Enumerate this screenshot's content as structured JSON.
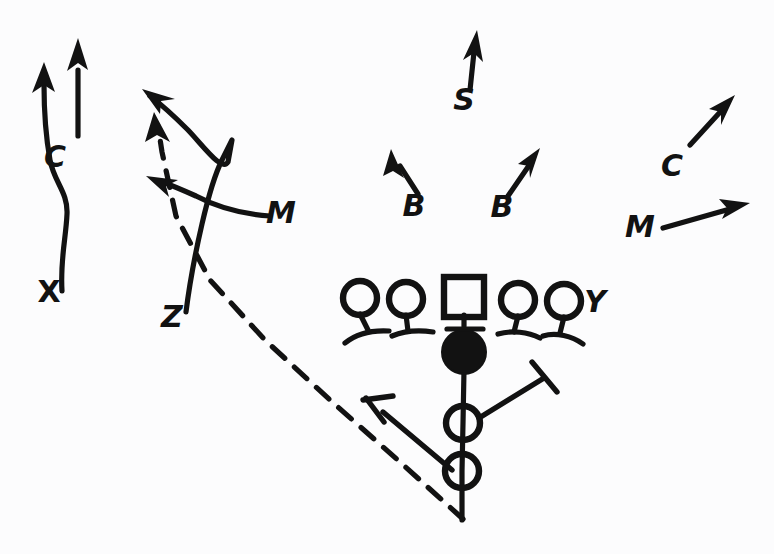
{
  "diagram": {
    "type": "hand-drawn-playbook",
    "background_color": "#fcfcfd",
    "ink_color": "#121212"
  },
  "offense": {
    "linemen": [
      {
        "id": "lt",
        "label": "",
        "shape": "circle",
        "x": 360,
        "y": 298
      },
      {
        "id": "lg",
        "label": "",
        "shape": "circle",
        "x": 406,
        "y": 299
      },
      {
        "id": "center",
        "label": "",
        "shape": "square",
        "x": 464,
        "y": 297
      },
      {
        "id": "rg",
        "label": "",
        "shape": "circle",
        "x": 518,
        "y": 300
      },
      {
        "id": "rt",
        "label": "",
        "shape": "circle",
        "x": 564,
        "y": 301
      }
    ],
    "quarterback": {
      "id": "qb",
      "label": "",
      "shape": "filled-circle",
      "x": 464,
      "y": 352
    },
    "backs": [
      {
        "id": "back-1",
        "label": "",
        "shape": "circle",
        "x": 462,
        "y": 423
      },
      {
        "id": "back-2",
        "label": "",
        "shape": "circle",
        "x": 462,
        "y": 471
      }
    ],
    "receivers": [
      {
        "id": "x-receiver",
        "label": "X",
        "label_x": 49,
        "label_y": 302
      },
      {
        "id": "y-receiver",
        "label": "Y",
        "label_x": 595,
        "label_y": 312
      },
      {
        "id": "z-receiver",
        "label": "Z",
        "label_x": 172,
        "label_y": 327
      }
    ]
  },
  "defense": {
    "players": [
      {
        "id": "corner-left",
        "label": "C",
        "label_x": 55,
        "label_y": 167
      },
      {
        "id": "mike-left",
        "label": "M",
        "label_x": 281,
        "label_y": 223
      },
      {
        "id": "safety",
        "label": "S",
        "label_x": 464,
        "label_y": 110
      },
      {
        "id": "backer-left",
        "label": "B",
        "label_x": 414,
        "label_y": 216
      },
      {
        "id": "backer-right",
        "label": "B",
        "label_x": 502,
        "label_y": 217
      },
      {
        "id": "corner-right",
        "label": "C",
        "label_x": 672,
        "label_y": 176
      },
      {
        "id": "mike-right",
        "label": "M",
        "label_x": 640,
        "label_y": 237
      }
    ]
  },
  "routes": [
    {
      "id": "x-route",
      "player": "X",
      "style": "solid",
      "terminator": "arrow"
    },
    {
      "id": "z-route",
      "player": "Z",
      "style": "solid",
      "terminator": "arrow"
    },
    {
      "id": "motion-route",
      "player": "back",
      "style": "dashed",
      "terminator": "arrow"
    },
    {
      "id": "corner-left-drop",
      "player": "C",
      "style": "solid",
      "terminator": "arrow"
    },
    {
      "id": "mike-left-blitz",
      "player": "M",
      "style": "solid",
      "terminator": "arrow"
    },
    {
      "id": "safety-drop",
      "player": "S",
      "style": "solid",
      "terminator": "arrow"
    },
    {
      "id": "backer-left-drop",
      "player": "B",
      "style": "solid",
      "terminator": "arrow"
    },
    {
      "id": "backer-right-drop",
      "player": "B",
      "style": "solid",
      "terminator": "arrow"
    },
    {
      "id": "corner-right-drop",
      "player": "C",
      "style": "solid",
      "terminator": "arrow"
    },
    {
      "id": "mike-right-flow",
      "player": "M",
      "style": "solid",
      "terminator": "arrow"
    }
  ],
  "blocks": [
    {
      "id": "block-left",
      "terminator": "t-bar"
    },
    {
      "id": "block-right",
      "terminator": "t-bar"
    }
  ]
}
